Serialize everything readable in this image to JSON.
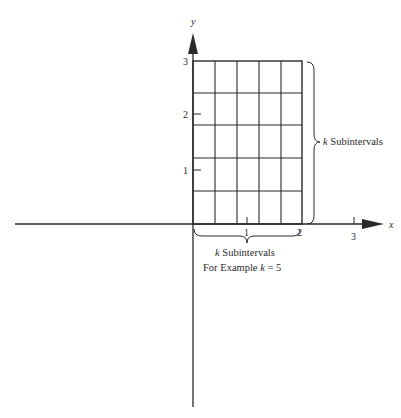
{
  "diagram": {
    "axes": {
      "x_label": "x",
      "y_label": "y",
      "x_ticks": [
        "1",
        "2",
        "3"
      ],
      "y_ticks": [
        "1",
        "2",
        "3"
      ]
    },
    "grid": {
      "columns": 5,
      "rows": 5,
      "x_range": [
        0,
        2
      ],
      "y_range": [
        0,
        3
      ]
    },
    "annotations": {
      "right_brace": {
        "k": "k",
        "text": "Subintervals"
      },
      "bottom_brace": {
        "line1_k": "k",
        "line1_text": "Subintervals",
        "line2_text": "For Example",
        "line2_k": "k",
        "line2_eq": "= 5"
      }
    },
    "colors": {
      "ink": "#2a2a2a",
      "background": "#ffffff"
    }
  }
}
